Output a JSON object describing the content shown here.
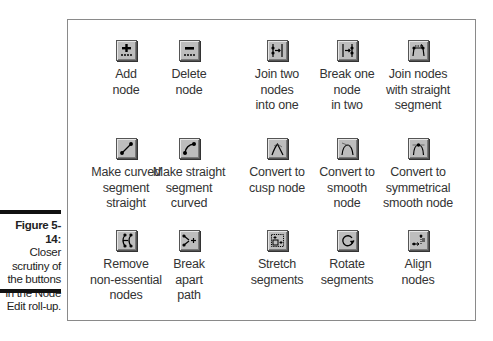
{
  "caption": {
    "title": "Figure 5-14:",
    "body": "Closer scrutiny of the buttons in the Node Edit roll-up."
  },
  "buttons": [
    {
      "label": "Add\nnode",
      "icon": "add-node-icon"
    },
    {
      "label": "Delete\nnode",
      "icon": "delete-node-icon"
    },
    {
      "label": "Join two\nnodes\ninto one",
      "icon": "join-nodes-icon"
    },
    {
      "label": "Break one\nnode\nin two",
      "icon": "break-node-icon"
    },
    {
      "label": "Join nodes\nwith straight\nsegment",
      "icon": "join-straight-segment-icon"
    },
    {
      "label": "Make curved\nsegment\nstraight",
      "icon": "to-line-icon"
    },
    {
      "label": "Make straight\nsegment\ncurved",
      "icon": "to-curve-icon"
    },
    {
      "label": "Convert to\ncusp node",
      "icon": "cusp-node-icon"
    },
    {
      "label": "Convert to\nsmooth\nnode",
      "icon": "smooth-node-icon"
    },
    {
      "label": "Convert to\nsymmetrical\nsmooth node",
      "icon": "symmetrical-node-icon"
    },
    {
      "label": "Remove\nnon-essential\nnodes",
      "icon": "auto-reduce-icon"
    },
    {
      "label": "Break\napart\npath",
      "icon": "break-apart-icon"
    },
    {
      "label": "Stretch\nsegments",
      "icon": "stretch-segments-icon"
    },
    {
      "label": "Rotate\nsegments",
      "icon": "rotate-segments-icon"
    },
    {
      "label": "Align\nnodes",
      "icon": "align-nodes-icon"
    }
  ]
}
